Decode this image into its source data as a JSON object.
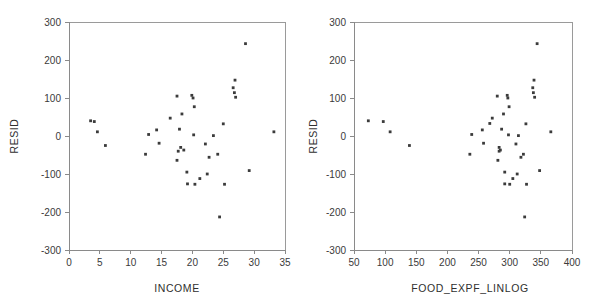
{
  "figure": {
    "background": "#ffffff",
    "point_color": "#3b3b3b",
    "axis_color": "#8a8a8a"
  },
  "chart_data": [
    {
      "type": "scatter",
      "panel": "left",
      "title": "",
      "xlabel": "INCOME",
      "ylabel": "RESID",
      "xlim": [
        0,
        35
      ],
      "ylim": [
        -300,
        300
      ],
      "xticks": [
        0,
        5,
        10,
        15,
        20,
        25,
        30,
        35
      ],
      "yticks": [
        -300,
        -200,
        -100,
        0,
        100,
        200,
        300
      ],
      "xticklabels": [
        "0",
        "5",
        "10",
        "15",
        "20",
        "25",
        "30",
        "35"
      ],
      "yticklabels": [
        "-300",
        "-200",
        "-100",
        "0",
        "100",
        "200",
        "300"
      ],
      "grid": false,
      "legend": null,
      "marker": "square",
      "points": [
        [
          3.5,
          40
        ],
        [
          4.1,
          38
        ],
        [
          4.6,
          11
        ],
        [
          5.9,
          -25
        ],
        [
          12.4,
          -48
        ],
        [
          12.9,
          4
        ],
        [
          14.2,
          16
        ],
        [
          14.6,
          -19
        ],
        [
          16.4,
          47
        ],
        [
          17.5,
          105
        ],
        [
          17.5,
          -64
        ],
        [
          17.7,
          -40
        ],
        [
          17.9,
          18
        ],
        [
          18.1,
          -30
        ],
        [
          18.3,
          58
        ],
        [
          18.6,
          -37
        ],
        [
          19.1,
          -95
        ],
        [
          19.2,
          -126
        ],
        [
          19.9,
          107
        ],
        [
          20.1,
          100
        ],
        [
          20.2,
          3
        ],
        [
          20.3,
          77
        ],
        [
          20.4,
          -127
        ],
        [
          21.2,
          -112
        ],
        [
          22.1,
          -21
        ],
        [
          22.4,
          -100
        ],
        [
          22.7,
          -56
        ],
        [
          23.4,
          1
        ],
        [
          24.1,
          -48
        ],
        [
          24.4,
          -213
        ],
        [
          25.0,
          32
        ],
        [
          25.2,
          -127
        ],
        [
          26.6,
          127
        ],
        [
          26.8,
          114
        ],
        [
          26.9,
          147
        ],
        [
          27.0,
          102
        ],
        [
          28.6,
          243
        ],
        [
          29.2,
          -91
        ],
        [
          33.2,
          11
        ]
      ]
    },
    {
      "type": "scatter",
      "panel": "right",
      "title": "",
      "xlabel": "FOOD_EXPF_LINLOG",
      "ylabel": "RESID",
      "xlim": [
        50,
        400
      ],
      "ylim": [
        -300,
        300
      ],
      "xticks": [
        50,
        100,
        150,
        200,
        250,
        300,
        350,
        400
      ],
      "yticks": [
        -300,
        -200,
        -100,
        0,
        100,
        200,
        300
      ],
      "xticklabels": [
        "50",
        "100",
        "150",
        "200",
        "250",
        "300",
        "350",
        "400"
      ],
      "yticklabels": [
        "-300",
        "-200",
        "-100",
        "0",
        "100",
        "200",
        "300"
      ],
      "grid": false,
      "legend": null,
      "marker": "square",
      "points": [
        [
          73,
          40
        ],
        [
          97,
          38
        ],
        [
          108,
          11
        ],
        [
          139,
          -25
        ],
        [
          236,
          -48
        ],
        [
          239,
          4
        ],
        [
          256,
          16
        ],
        [
          258,
          -19
        ],
        [
          268,
          33
        ],
        [
          272,
          47
        ],
        [
          280,
          105
        ],
        [
          281,
          -64
        ],
        [
          283,
          -40
        ],
        [
          283,
          -30
        ],
        [
          285,
          -37
        ],
        [
          287,
          18
        ],
        [
          290,
          58
        ],
        [
          292,
          -95
        ],
        [
          292,
          -126
        ],
        [
          296,
          107
        ],
        [
          297,
          100
        ],
        [
          298,
          3
        ],
        [
          299,
          77
        ],
        [
          300,
          -127
        ],
        [
          305,
          -112
        ],
        [
          310,
          -21
        ],
        [
          312,
          -100
        ],
        [
          314,
          1
        ],
        [
          318,
          -56
        ],
        [
          322,
          -48
        ],
        [
          324,
          -213
        ],
        [
          326,
          32
        ],
        [
          327,
          -127
        ],
        [
          337,
          127
        ],
        [
          338,
          114
        ],
        [
          339,
          147
        ],
        [
          340,
          102
        ],
        [
          344,
          243
        ],
        [
          348,
          -91
        ],
        [
          366,
          11
        ]
      ]
    }
  ]
}
